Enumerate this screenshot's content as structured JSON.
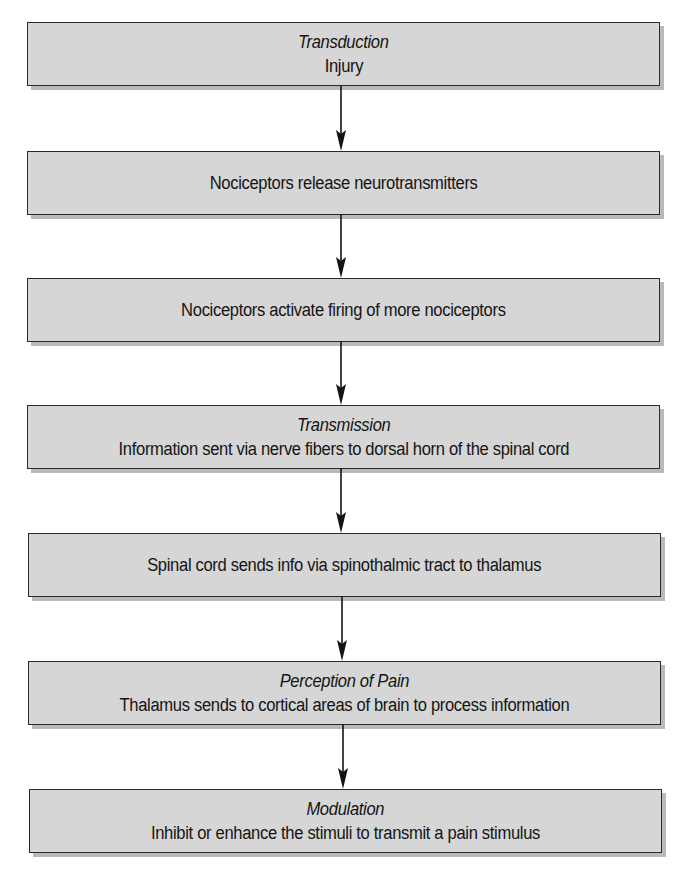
{
  "diagram": {
    "type": "flowchart",
    "direction": "top-to-bottom",
    "colors": {
      "box_fill": "#d6d6d6",
      "box_border": "#2a2a2a",
      "box_shadow": "#b9b9b9",
      "text": "#141414",
      "arrow": "#141414",
      "background": "#ffffff"
    },
    "steps": [
      {
        "heading": "Transduction",
        "text": "Injury"
      },
      {
        "heading": "",
        "text": "Nociceptors release neurotransmitters"
      },
      {
        "heading": "",
        "text": "Nociceptors activate firing of more nociceptors"
      },
      {
        "heading": "Transmission",
        "text": "Information sent via nerve fibers to dorsal horn of the spinal cord"
      },
      {
        "heading": "",
        "text": "Spinal cord sends info via spinothalmic tract to thalamus"
      },
      {
        "heading": "Perception of Pain",
        "text": "Thalamus sends to cortical areas of brain to process information"
      },
      {
        "heading": "Modulation",
        "text": "Inhibit or enhance the stimuli to transmit a pain stimulus"
      }
    ],
    "connectors": [
      {
        "from": 0,
        "to": 1,
        "icon": "arrow-down-icon"
      },
      {
        "from": 1,
        "to": 2,
        "icon": "arrow-down-icon"
      },
      {
        "from": 2,
        "to": 3,
        "icon": "arrow-down-icon"
      },
      {
        "from": 3,
        "to": 4,
        "icon": "arrow-down-icon"
      },
      {
        "from": 4,
        "to": 5,
        "icon": "arrow-down-icon"
      },
      {
        "from": 5,
        "to": 6,
        "icon": "arrow-down-icon"
      }
    ]
  }
}
